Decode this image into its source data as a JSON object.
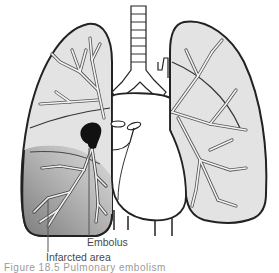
{
  "figure": {
    "type": "medical-illustration",
    "labels": {
      "embolus": "Embolus",
      "infarcted_area": "Infarcted area"
    },
    "caption_partial": "Figure 18.5  Pulmonary embolism",
    "colors": {
      "lung_fill": "#e3e3e3",
      "infarct_fill_dark": "#8a8a8a",
      "infarct_fill_light": "#c9c9c9",
      "embolus_fill": "#111111",
      "outline": "#222222",
      "vessel_fill": "#ffffff",
      "label_text": "#4a4a4a"
    }
  }
}
